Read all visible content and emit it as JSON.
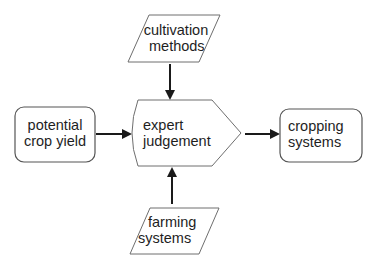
{
  "diagram": {
    "type": "flowchart",
    "colors": {
      "stroke": "#6e6e6e",
      "arrow": "#1a1a1a",
      "text": "#1e1e1e",
      "fill": "#ffffff"
    },
    "nodes": {
      "cultivation_methods": {
        "shape": "parallelogram",
        "line1": "cultivation",
        "line2": "methods"
      },
      "potential_crop_yield": {
        "shape": "rounded-rectangle",
        "line1": "potential",
        "line2": "crop yield"
      },
      "expert_judgement": {
        "shape": "pentagon-arrow",
        "line1": "expert",
        "line2": "judgement"
      },
      "cropping_systems": {
        "shape": "rounded-rectangle",
        "line1": "cropping",
        "line2": "systems"
      },
      "farming_systems": {
        "shape": "parallelogram",
        "line1": "farming",
        "line2": "systems"
      }
    },
    "edges": [
      {
        "from": "cultivation methods",
        "to": "expert judgement",
        "direction": "down"
      },
      {
        "from": "potential crop yield",
        "to": "expert judgement",
        "direction": "right"
      },
      {
        "from": "farming systems",
        "to": "expert judgement",
        "direction": "up"
      },
      {
        "from": "expert judgement",
        "to": "cropping systems",
        "direction": "right"
      }
    ]
  }
}
